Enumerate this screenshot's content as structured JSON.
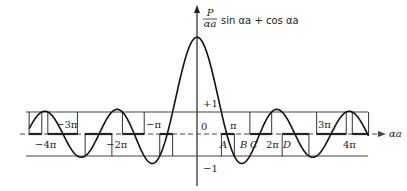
{
  "figure": {
    "title_fraction_num": "P",
    "title_fraction_den": "αa",
    "title_expr": "sin αa + cos αa",
    "x_axis_label": "αa",
    "y_plus_label": "+1",
    "y_minus_label": "−1",
    "origin_label": "0",
    "point_labels": [
      "A",
      "B",
      "C",
      "D"
    ],
    "tick_labels": [
      "−4π",
      "−3π",
      "−2π",
      "−π",
      "π",
      "2π",
      "3π",
      "4π"
    ]
  },
  "chart_data": {
    "type": "line",
    "xlabel": "αa",
    "ylabel": "",
    "function": "f(x) = P·sin(x)/x + cos(x)",
    "P": 3.4,
    "x_range_pi": [
      -4.5,
      4.6
    ],
    "y_peak_at_0": 4.4,
    "reference_lines": [
      1,
      0,
      -1
    ],
    "x_ticks_pi": [
      -4,
      -3,
      -2,
      -1,
      1,
      2,
      3,
      4
    ],
    "annotations": [
      "A",
      "B",
      "C",
      "D"
    ],
    "bands": "allowed where |f(x)| ≤ 1, drawn as rectangles between +1 and axis/-1"
  }
}
